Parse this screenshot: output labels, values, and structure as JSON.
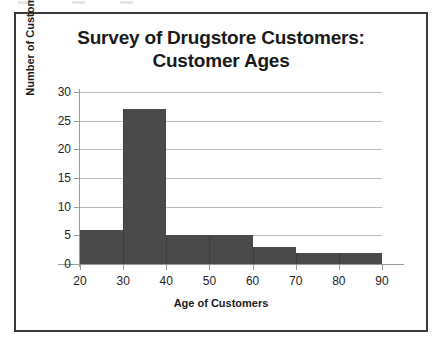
{
  "chart_data": {
    "type": "bar",
    "title": "Survey of Drugstore Customers: Customer Ages",
    "title_lines": [
      "Survey of Drugstore Customers:",
      "Customer Ages"
    ],
    "xlabel": "Age of Customers",
    "ylabel": "Number of Customers",
    "categories": [
      "20-30",
      "30-40",
      "40-50",
      "50-60",
      "60-70",
      "70-80",
      "80-90"
    ],
    "bin_edges": [
      20,
      30,
      40,
      50,
      60,
      70,
      80,
      90
    ],
    "values": [
      6,
      27,
      5,
      5,
      3,
      2,
      2
    ],
    "xlim": [
      20,
      90
    ],
    "ylim": [
      0,
      30
    ],
    "x_ticks": [
      20,
      30,
      40,
      50,
      60,
      70,
      80,
      90
    ],
    "y_ticks": [
      0,
      5,
      10,
      15,
      20,
      25,
      30
    ],
    "x_tick_labels": [
      "20",
      "30",
      "40",
      "50",
      "60",
      "70",
      "80",
      "90"
    ],
    "y_tick_labels": [
      "0",
      "5",
      "10",
      "15",
      "20",
      "25",
      "30"
    ],
    "grid": "horizontal",
    "legend": "none",
    "bar_color": "#4a4a4c",
    "grid_color": "#bcbcbc",
    "axis_color": "#9a9a9a",
    "frame_color": "#3a3a3c",
    "background_color": "#ffffff"
  }
}
